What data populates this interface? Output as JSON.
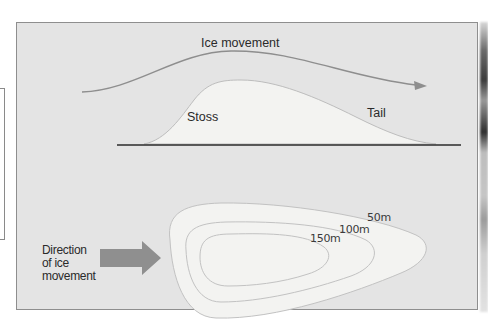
{
  "diagram": {
    "profile": {
      "flow_label": "Ice movement",
      "stoss_label": "Stoss",
      "tail_label": "Tail"
    },
    "plan": {
      "direction_label_lines": [
        "Direction",
        "of ice",
        "movement"
      ],
      "contours": [
        {
          "label": "50m",
          "elevation_m": 50
        },
        {
          "label": "100m",
          "elevation_m": 100
        },
        {
          "label": "150m",
          "elevation_m": 150
        }
      ]
    },
    "colors": {
      "panel_background": "#e4e4e4",
      "drumlin_fill": "#f3f3f1",
      "contour_line": "#bdbdbd",
      "flow_line": "#8e8e8e",
      "arrow_fill": "#8f8f8f",
      "ground_line": "#2b2b2b",
      "text": "#2a2a2a"
    }
  }
}
